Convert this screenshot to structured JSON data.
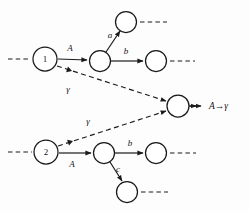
{
  "diagram": {
    "background_color": "#fdfdfd",
    "stroke_color": "#1a1a1a",
    "nodes": [
      {
        "id": "n1",
        "name": "node-1",
        "label": "1",
        "cx": 45,
        "cy": 59,
        "r": 12
      },
      {
        "id": "n2",
        "name": "node-top-mid",
        "label": "",
        "cx": 100,
        "cy": 61,
        "r": 10.5
      },
      {
        "id": "n3",
        "name": "node-top-branch-a",
        "label": "",
        "cx": 126,
        "cy": 22,
        "r": 10.5
      },
      {
        "id": "n4",
        "name": "node-top-branch-b",
        "label": "",
        "cx": 156,
        "cy": 61,
        "r": 10.5
      },
      {
        "id": "n5",
        "name": "node-merge",
        "label": "",
        "cx": 178,
        "cy": 106,
        "r": 11
      },
      {
        "id": "n6",
        "name": "node-2",
        "label": "2",
        "cx": 46,
        "cy": 152,
        "r": 12
      },
      {
        "id": "n7",
        "name": "node-bot-mid",
        "label": "",
        "cx": 104,
        "cy": 153,
        "r": 10.5
      },
      {
        "id": "n8",
        "name": "node-bot-branch-b",
        "label": "",
        "cx": 156,
        "cy": 153,
        "r": 10.5
      },
      {
        "id": "n9",
        "name": "node-bot-branch-c",
        "label": "",
        "cx": 127,
        "cy": 192,
        "r": 10.5
      }
    ],
    "edge_labels": [
      {
        "name": "edge-label-A-top",
        "text": "A",
        "x": 70,
        "y": 51,
        "style": "italic"
      },
      {
        "name": "edge-label-a-top",
        "text": "a",
        "x": 110,
        "y": 38,
        "style": "italic"
      },
      {
        "name": "edge-label-b-top",
        "text": "b",
        "x": 126,
        "y": 54,
        "style": "italic"
      },
      {
        "name": "edge-label-gamma-top",
        "text": "γ",
        "x": 68,
        "y": 92,
        "style": "italic"
      },
      {
        "name": "edge-label-gamma-bot",
        "text": "γ",
        "x": 88,
        "y": 124,
        "style": "italic"
      },
      {
        "name": "edge-label-A-bot",
        "text": "A",
        "x": 72,
        "y": 167,
        "style": "italic"
      },
      {
        "name": "edge-label-b-bot",
        "text": "b",
        "x": 130,
        "y": 146,
        "style": "italic"
      },
      {
        "name": "edge-label-c-bot",
        "text": "c",
        "x": 118,
        "y": 172,
        "style": "italic"
      }
    ],
    "result": {
      "name": "result-label",
      "text": "A→γ",
      "x": 209,
      "y": 109
    },
    "dangling_stubs": [
      {
        "name": "stub-into-node-1",
        "x1": 8,
        "y1": 59,
        "x2": 31,
        "y2": 59
      },
      {
        "name": "stub-out-node-top-branch-a",
        "x1": 140,
        "y1": 22,
        "x2": 167,
        "y2": 22
      },
      {
        "name": "stub-out-node-top-branch-b",
        "x1": 170,
        "y1": 61,
        "x2": 195,
        "y2": 61
      },
      {
        "name": "stub-into-node-2",
        "x1": 8,
        "y1": 152,
        "x2": 32,
        "y2": 152
      },
      {
        "name": "stub-out-node-bot-branch-b",
        "x1": 170,
        "y1": 153,
        "x2": 196,
        "y2": 153
      },
      {
        "name": "stub-out-node-bot-branch-c",
        "x1": 141,
        "y1": 192,
        "x2": 168,
        "y2": 192
      }
    ],
    "solid_edges": [
      {
        "name": "edge-n1-to-top-mid",
        "x1": 58,
        "y1": 59,
        "x2": 87,
        "y2": 60
      },
      {
        "name": "edge-top-mid-to-branch-a",
        "x1": 106,
        "y1": 52,
        "x2": 120,
        "y2": 31
      },
      {
        "name": "edge-top-mid-to-branch-b",
        "x1": 111,
        "y1": 61,
        "x2": 143,
        "y2": 61
      },
      {
        "name": "edge-n2-to-bot-mid",
        "x1": 59,
        "y1": 153,
        "x2": 91,
        "y2": 153
      },
      {
        "name": "edge-bot-mid-to-branch-b",
        "x1": 115,
        "y1": 153,
        "x2": 143,
        "y2": 153
      },
      {
        "name": "edge-bot-mid-to-branch-c",
        "x1": 110,
        "y1": 162,
        "x2": 122,
        "y2": 181
      },
      {
        "name": "edge-merge-to-result",
        "x1": 190,
        "y1": 106,
        "x2": 201,
        "y2": 106
      }
    ],
    "dashed_edges": [
      {
        "name": "edge-gamma-n1-to-merge",
        "x1": 57,
        "y1": 66,
        "x2": 166,
        "y2": 101
      },
      {
        "name": "edge-gamma-n2-to-merge",
        "x1": 58,
        "y1": 146,
        "x2": 166,
        "y2": 111
      }
    ],
    "gamma_arrow_mid": [
      {
        "name": "arrowhead-gamma-top-start",
        "x": 72,
        "y": 71
      },
      {
        "name": "arrowhead-gamma-bot-start",
        "x": 73,
        "y": 141
      }
    ]
  }
}
